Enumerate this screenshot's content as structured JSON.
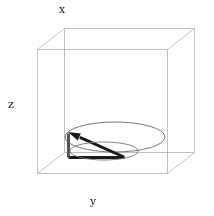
{
  "figure": {
    "type": "3d-vector-plot",
    "width": 214,
    "height": 216,
    "background_color": "#ffffff"
  },
  "axes": {
    "x_label": "x",
    "y_label": "y",
    "z_label": "z",
    "box_color": "#b0b0b0",
    "box_line_width": 0.8
  },
  "chart_data": {
    "type": "scatter",
    "title": "",
    "xlabel": "x",
    "ylabel": "y",
    "zlabel": "z",
    "grid": false,
    "legend": null,
    "projection": "3d",
    "bounding_box": {
      "front_top_left": [
        37,
        49
      ],
      "front_top_right": [
        167,
        49
      ],
      "front_bottom_left": [
        37,
        173
      ],
      "front_bottom_right": [
        167,
        173
      ],
      "back_top_left": [
        64,
        28
      ],
      "back_top_right": [
        194,
        28
      ],
      "back_bottom_left": [
        64,
        152
      ],
      "back_bottom_right": [
        194,
        152
      ]
    },
    "elements": [
      {
        "name": "unit-circle",
        "shape": "ellipse",
        "center": [
          115,
          137
        ],
        "radius_x": 50,
        "radius_y": 15,
        "color": "#666666",
        "line_width": 0.9
      },
      {
        "name": "vector-arrow",
        "shape": "arrow",
        "from": [
          124,
          157
        ],
        "to": [
          68,
          132
        ],
        "color": "#1a1a1a",
        "line_width": 3
      },
      {
        "name": "vector-baseline",
        "shape": "line",
        "from": [
          68,
          157
        ],
        "to": [
          124,
          157
        ],
        "color": "#1a1a1a",
        "line_width": 3
      },
      {
        "name": "vector-vertical-leg",
        "shape": "line",
        "from": [
          68,
          157
        ],
        "to": [
          68,
          133
        ],
        "color": "#555555",
        "line_width": 3
      },
      {
        "name": "small-ellipse",
        "shape": "ellipse",
        "center": [
          104,
          151
        ],
        "radius_x": 34,
        "radius_y": 9,
        "color": "#777777",
        "line_width": 0.9
      }
    ]
  }
}
